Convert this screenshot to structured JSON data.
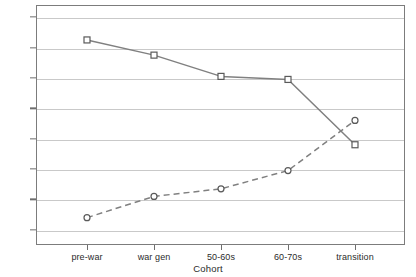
{
  "chart_data": {
    "type": "line",
    "title": "",
    "xlabel": "Cohort",
    "ylabel": "",
    "categories": [
      "pre-war",
      "war gen",
      "50-60s",
      "60-70s",
      "transition"
    ],
    "series": [
      {
        "name": "solid-square-series",
        "marker": "square",
        "linestyle": "solid",
        "color": "#808080",
        "values": [
          0.65,
          0.55,
          0.41,
          0.39,
          -0.04
        ]
      },
      {
        "name": "dashed-circle-series",
        "marker": "circle",
        "linestyle": "dashed",
        "color": "#808080",
        "values": [
          -0.52,
          -0.38,
          -0.33,
          -0.21,
          0.12
        ]
      }
    ],
    "ylim": [
      -0.7,
      0.88
    ],
    "yticks": [
      0.8,
      0.6,
      0.4,
      0.2,
      0.0,
      -0.2,
      -0.4,
      -0.6
    ],
    "ytick_labels": [
      "0,80",
      "0,60",
      "0,40",
      "0,20",
      "0,00",
      "-0,20",
      "-0,40",
      "-0,60"
    ],
    "grid": "horizontal",
    "legend": "none",
    "decimal_separator": ",",
    "frame_color": "#7c7c7c",
    "grid_color": "#c9c9c9",
    "background": "#ffffff"
  }
}
